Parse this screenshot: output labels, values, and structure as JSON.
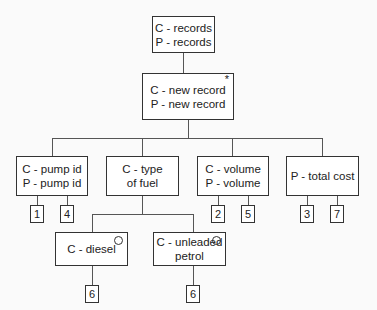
{
  "diagram": {
    "root": {
      "lines": [
        "C - records",
        "P - records"
      ]
    },
    "record": {
      "lines": [
        "C - new record",
        "P - new record"
      ],
      "marker": "*"
    },
    "children": [
      {
        "id": "pump",
        "lines": [
          "C - pump id",
          "P - pump id"
        ],
        "ops": [
          "1",
          "4"
        ]
      },
      {
        "id": "fuel",
        "lines": [
          "C - type",
          "of fuel"
        ],
        "ops": []
      },
      {
        "id": "volume",
        "lines": [
          "C - volume",
          "P - volume"
        ],
        "ops": [
          "2",
          "5"
        ]
      },
      {
        "id": "cost",
        "lines": [
          "P - total cost"
        ],
        "ops": [
          "3",
          "7"
        ]
      }
    ],
    "fuel_options": [
      {
        "id": "diesel",
        "lines": [
          "C - diesel"
        ],
        "marker": "o",
        "ops": [
          "6"
        ]
      },
      {
        "id": "unleaded",
        "lines": [
          "C - unleaded",
          "petrol"
        ],
        "marker": "o",
        "ops": [
          "6"
        ]
      }
    ]
  }
}
